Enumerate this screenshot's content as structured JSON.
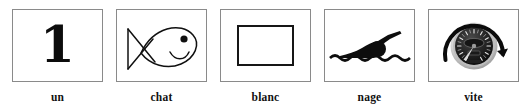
{
  "strip": {
    "name": "french-rebus-sentence",
    "sentence": "un chat blanc nage vite",
    "card_count": 5,
    "background_color": "#ffffff",
    "border_color": "#8a8a8a",
    "ink_color": "#111111"
  },
  "cards": [
    {
      "id": "card-un",
      "caption": "un",
      "picture": "numeral-one",
      "numeral": "1",
      "alt": "the digit one in bold serif"
    },
    {
      "id": "card-chat",
      "caption": "chat",
      "picture": "fish-outline-icon",
      "alt": "line drawing of a fish facing right with crossed tail, round eye and smile"
    },
    {
      "id": "card-blanc",
      "caption": "blanc",
      "picture": "empty-white-rectangle-icon",
      "alt": "an empty white rectangle outlined in black"
    },
    {
      "id": "card-nage",
      "caption": "nage",
      "picture": "swimmer-icon",
      "alt": "black silhouette of a person swimming front crawl above a wavy water line"
    },
    {
      "id": "card-vite",
      "caption": "vite",
      "picture": "speedometer-icon",
      "alt": "dark round speedometer gauge with a clockwise sweeping arrow around it"
    }
  ]
}
